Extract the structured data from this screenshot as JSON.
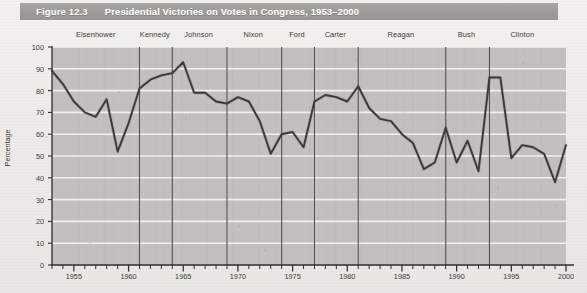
{
  "figure": {
    "number_label": "Figure 12.3",
    "title": "Presidential Victories on Votes in Congress, 1953–2000"
  },
  "axes": {
    "y_axis_title": "Percentage",
    "y_ticks": [
      0,
      10,
      20,
      30,
      40,
      50,
      60,
      70,
      80,
      90,
      100
    ],
    "x_ticks": [
      1955,
      1960,
      1965,
      1970,
      1975,
      1980,
      1985,
      1990,
      1995,
      2000
    ],
    "x_range": [
      1953,
      2000
    ],
    "y_range": [
      0,
      100
    ]
  },
  "presidents": [
    {
      "name": "Eisenhower",
      "start": 1953,
      "end": 1961,
      "label_year": 1957.0
    },
    {
      "name": "Kennedy",
      "start": 1961,
      "end": 1964,
      "label_year": 1962.4
    },
    {
      "name": "Johnson",
      "start": 1964,
      "end": 1969,
      "label_year": 1966.4
    },
    {
      "name": "Nixon",
      "start": 1969,
      "end": 1974,
      "label_year": 1971.4
    },
    {
      "name": "Ford",
      "start": 1974,
      "end": 1977,
      "label_year": 1975.4
    },
    {
      "name": "Carter",
      "start": 1977,
      "end": 1981,
      "label_year": 1978.9
    },
    {
      "name": "Reagan",
      "start": 1981,
      "end": 1989,
      "label_year": 1984.9
    },
    {
      "name": "Bush",
      "start": 1989,
      "end": 1993,
      "label_year": 1990.9
    },
    {
      "name": "Clinton",
      "start": 1993,
      "end": 2000,
      "label_year": 1996.0
    }
  ],
  "divider_years": [
    1961,
    1964,
    1969,
    1974,
    1977,
    1981,
    1989,
    1993
  ],
  "colors": {
    "header_band": "#9d9b98",
    "header_text": "#ffffff",
    "plot_background": "#c2c0bd",
    "gridline": "#f4f3f1",
    "data_line": "#3a3a3a",
    "divider_line": "#4a4a52",
    "axis_line": "#2e2e2e",
    "page_background": "#efeeec"
  },
  "chart_data": {
    "type": "line",
    "title": "Presidential Victories on Votes in Congress, 1953–2000",
    "xlabel": "",
    "ylabel": "Percentage",
    "xlim": [
      1953,
      2000
    ],
    "ylim": [
      0,
      100
    ],
    "grid": "horizontal",
    "legend": "none",
    "x": [
      1953,
      1954,
      1955,
      1956,
      1957,
      1958,
      1959,
      1960,
      1961,
      1962,
      1963,
      1964,
      1965,
      1966,
      1967,
      1968,
      1969,
      1970,
      1971,
      1972,
      1973,
      1974,
      1975,
      1976,
      1977,
      1978,
      1979,
      1980,
      1981,
      1982,
      1983,
      1984,
      1985,
      1986,
      1987,
      1988,
      1989,
      1990,
      1991,
      1992,
      1993,
      1994,
      1995,
      1996,
      1997,
      1998,
      1999,
      2000
    ],
    "series": [
      {
        "name": "Presidential victories on congressional votes (%)",
        "values": [
          89,
          83,
          75,
          70,
          68,
          76,
          52,
          65,
          81,
          85,
          87,
          88,
          93,
          79,
          79,
          75,
          74,
          77,
          75,
          66,
          51,
          60,
          61,
          54,
          75,
          78,
          77,
          75,
          82,
          72,
          67,
          66,
          60,
          56,
          44,
          47,
          63,
          47,
          57,
          43,
          86,
          86,
          49,
          55,
          54,
          51,
          38,
          55
        ]
      }
    ]
  }
}
